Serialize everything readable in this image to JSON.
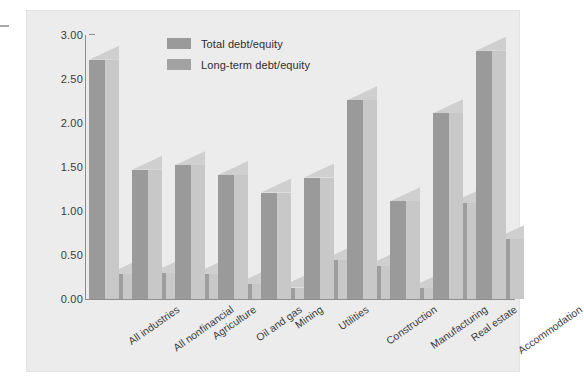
{
  "chart_data": {
    "type": "bar",
    "title": "",
    "subtitle": "",
    "xlabel": "",
    "ylabel": "Ratio",
    "ylim": [
      0.0,
      3.0
    ],
    "ytick_labels": [
      "3.00",
      "2.50",
      "2.00",
      "1.50",
      "1.00",
      "0.50",
      "0.00"
    ],
    "ytick_values": [
      3.0,
      2.5,
      2.0,
      1.5,
      1.0,
      0.5,
      0.0
    ],
    "grid": false,
    "legend_position": "top-center",
    "style": "3d-extruded-grouped-bars",
    "categories": [
      "All industries",
      "All nonfinancial",
      "Agriculture",
      "Oil and gas",
      "Mining",
      "Utilities",
      "Construction",
      "Manufacturing",
      "Real estate",
      "Accommodation"
    ],
    "series": [
      {
        "name": "Total debt/equity",
        "color": "#9a9a9a",
        "values": [
          2.72,
          1.47,
          1.52,
          1.41,
          1.21,
          1.38,
          2.26,
          1.11,
          2.11,
          2.82
        ]
      },
      {
        "name": "Long-term debt/equity",
        "color": "#9e9e9e",
        "values": [
          0.28,
          0.29,
          0.28,
          0.17,
          0.13,
          0.44,
          0.37,
          0.12,
          1.09,
          0.68
        ]
      }
    ]
  },
  "legend": {
    "items": [
      {
        "label": "Total debt/equity",
        "color": "#9a9a9a"
      },
      {
        "label": "Long-term debt/equity",
        "color": "#a2a2a2"
      }
    ]
  },
  "colors": {
    "figure_background": "#ececec",
    "page_background": "#ffffff",
    "bar_face": "#9a9a9a",
    "bar_side": "#c8c8c8",
    "bar_top": "#d2d2d2",
    "axis": "#8d8d8d",
    "text": "#3a3a3a"
  }
}
